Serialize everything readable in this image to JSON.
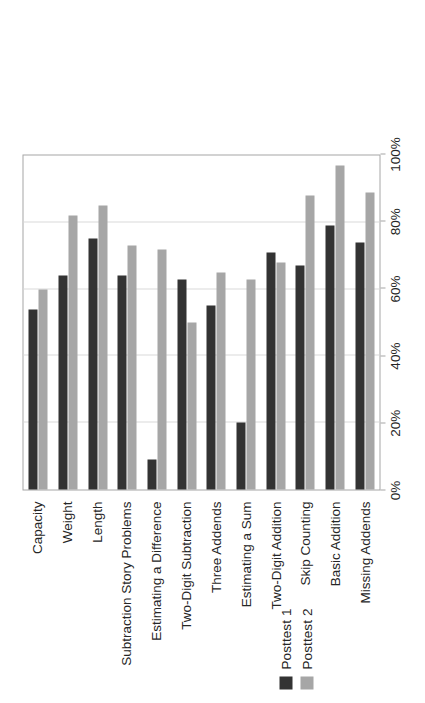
{
  "chart_data": {
    "type": "bar",
    "title": "",
    "subtitle": "",
    "xlabel": "",
    "ylabel": "",
    "orientation": "rotated-90",
    "grid": true,
    "legend_position": "top-left",
    "value_axis": {
      "min": 0,
      "max": 100,
      "tick_step": 20,
      "tick_labels": [
        "0%",
        "20%",
        "40%",
        "60%",
        "80%",
        "100%"
      ],
      "tick_values": [
        0,
        20,
        40,
        60,
        80,
        100
      ]
    },
    "categories": [
      "Capacity",
      "Weight",
      "Length",
      "Subtraction Story Problems",
      "Estimating a Difference",
      "Two-Digit Subtraction",
      "Three Addends",
      "Estimating a Sum",
      "Two-Digit Addition",
      "Skip Counting",
      "Basic Addition",
      "Missing Addends"
    ],
    "series": [
      {
        "name": "Posttest 1",
        "color": "#333333",
        "values": [
          54,
          64,
          75,
          64,
          9,
          63,
          55,
          20,
          71,
          67,
          79,
          74
        ]
      },
      {
        "name": "Posttest 2",
        "color": "#a6a6a6",
        "values": [
          60,
          82,
          85,
          73,
          72,
          50,
          65,
          63,
          68,
          88,
          97,
          89
        ]
      }
    ]
  },
  "legend": {
    "items": [
      {
        "label": "Posttest 1",
        "color": "#333333"
      },
      {
        "label": "Posttest 2",
        "color": "#a6a6a6"
      }
    ]
  }
}
